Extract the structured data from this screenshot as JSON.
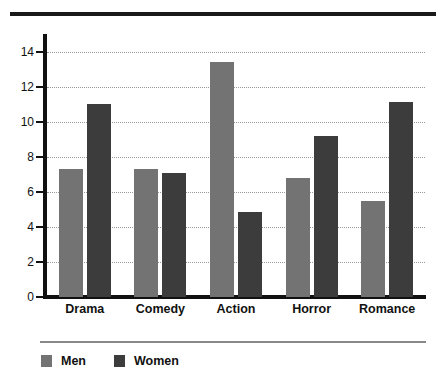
{
  "chart_data": {
    "type": "bar",
    "title": "",
    "subtitle": "",
    "xlabel": "",
    "ylabel": "",
    "categories": [
      "Drama",
      "Comedy",
      "Action",
      "Horror",
      "Romance"
    ],
    "series": [
      {
        "name": "Men",
        "color": "#737373",
        "values": [
          7.3,
          7.3,
          13.4,
          6.8,
          5.5
        ]
      },
      {
        "name": "Women",
        "color": "#3c3c3c",
        "values": [
          11.0,
          7.1,
          4.85,
          9.2,
          11.1
        ]
      }
    ],
    "ylim": [
      0,
      15
    ],
    "yticks": [
      0,
      2,
      4,
      6,
      8,
      10,
      12,
      14
    ],
    "ytick_labels": [
      "0",
      "2",
      "4",
      "6",
      "8",
      "10",
      "12",
      "14"
    ],
    "gridlines": {
      "axis": "y",
      "style": "dotted",
      "values": [
        2,
        4,
        6,
        8,
        10,
        12,
        14
      ]
    },
    "grid": true,
    "legend": {
      "position": "bottom-left",
      "entries": [
        {
          "label": "Men",
          "color": "#737373"
        },
        {
          "label": "Women",
          "color": "#3c3c3c"
        }
      ]
    },
    "decorations": {
      "top_rule": true,
      "legend_separator_rule": true
    }
  }
}
